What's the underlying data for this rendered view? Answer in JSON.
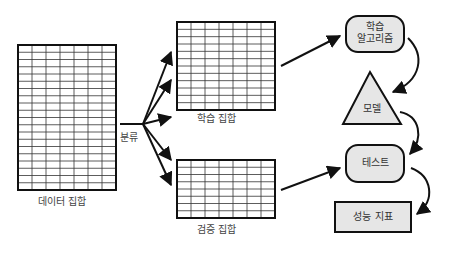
{
  "diagram": {
    "title": "",
    "colors": {
      "stroke": "#111111",
      "grid": "#333333",
      "node_fill": "#e6e6e6",
      "text": "#444444"
    },
    "tables": {
      "dataset": {
        "label": "데이터 집합",
        "cols": 7,
        "rows": 20
      },
      "training_set": {
        "label": "학습 집합",
        "cols": 7,
        "rows": 12
      },
      "validation_set": {
        "label": "검증 집합",
        "cols": 7,
        "rows": 8
      }
    },
    "split_label": "분류",
    "nodes": {
      "algorithm": {
        "label_line1": "학습",
        "label_line2": "알고리즘",
        "shape": "rounded-rect"
      },
      "model": {
        "label": "모델",
        "shape": "triangle"
      },
      "test": {
        "label": "테스트",
        "shape": "rounded-rect"
      },
      "metrics": {
        "label": "성능 지표",
        "shape": "rect"
      }
    },
    "edges": [
      {
        "from": "dataset",
        "to": "training_set",
        "label": "분류"
      },
      {
        "from": "dataset",
        "to": "validation_set",
        "label": "분류"
      },
      {
        "from": "training_set",
        "to": "algorithm"
      },
      {
        "from": "algorithm",
        "to": "model"
      },
      {
        "from": "model",
        "to": "test"
      },
      {
        "from": "validation_set",
        "to": "test"
      },
      {
        "from": "test",
        "to": "metrics"
      }
    ]
  }
}
